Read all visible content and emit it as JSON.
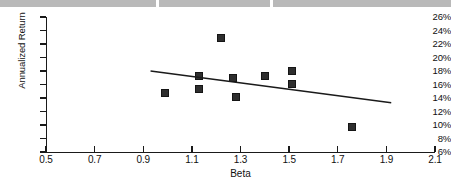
{
  "chart_data": {
    "type": "scatter",
    "title": "",
    "subtitle": "",
    "xlabel": "Beta",
    "ylabel": "Annualized Return",
    "xlim": [
      0.5,
      2.1
    ],
    "ylim": [
      6,
      26
    ],
    "grid": false,
    "legend": "none",
    "x_tick_labels": [
      "0.5",
      "0.7",
      "0.9",
      "1.1",
      "1.3",
      "1.5",
      "1.7",
      "1.9",
      "2.1"
    ],
    "x_tick_values": [
      0.5,
      0.7,
      0.9,
      1.1,
      1.3,
      1.5,
      1.7,
      1.9,
      2.1
    ],
    "y_tick_labels": [
      "26%",
      "24%",
      "22%",
      "20%",
      "18%",
      "16%",
      "14%",
      "12%",
      "10%",
      "8%",
      "6%"
    ],
    "y_tick_values": [
      26,
      24,
      22,
      20,
      18,
      16,
      14,
      12,
      10,
      8,
      6
    ],
    "marker": "filled-square",
    "marker_color": "#2e2e2e",
    "series": [
      {
        "name": "Funds",
        "x": [
          0.99,
          1.13,
          1.13,
          1.22,
          1.27,
          1.28,
          1.4,
          1.51,
          1.51,
          1.76
        ],
        "y": [
          14.7,
          17.3,
          15.4,
          22.9,
          17.0,
          14.2,
          17.3,
          18.0,
          16.1,
          9.7
        ]
      }
    ],
    "trendline": {
      "type": "linear",
      "x_start": 0.93,
      "y_start": 18.0,
      "x_end": 1.92,
      "y_end": 13.3,
      "color": "#1a1a1a"
    },
    "annotations": []
  },
  "page": {
    "scan_banner_color": "#b9b9b9",
    "background_color": "#ffffff",
    "axis_color": "#1a1a1a"
  }
}
